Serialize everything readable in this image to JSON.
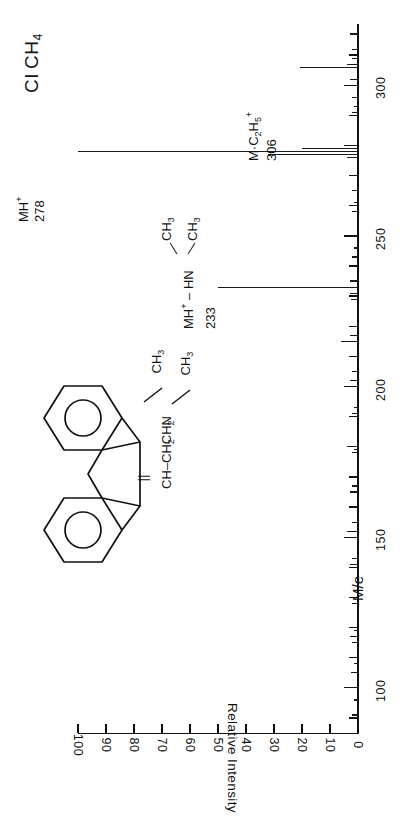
{
  "title": {
    "method": "CI",
    "reagent_gas": "CH",
    "reagent_gas_sub": "4"
  },
  "axes": {
    "x_axis_label": "M/e",
    "y_axis_label": "Relative Intensity",
    "mz_ticks": [
      100,
      150,
      200,
      250,
      300
    ],
    "intensity_ticks": [
      0,
      10,
      20,
      30,
      40,
      50,
      60,
      70,
      80,
      90,
      100
    ]
  },
  "annotations": [
    {
      "id": "ann278",
      "line1": "MH",
      "sup1": "+",
      "line2": "278",
      "mz": 278
    },
    {
      "id": "ann306",
      "line1": "M·C",
      "sub1": "2",
      "mid1": "H",
      "sub2": "5",
      "sup1": "+",
      "line2": "306",
      "mz": 306
    },
    {
      "id": "ann233",
      "line1": "MH",
      "sup1": "+",
      "dash": "–",
      "hn": "HN",
      "ch3_a": "CH",
      "ch3_a_sub": "3",
      "ch3_b": "CH",
      "ch3_b_sub": "3",
      "line2": "233",
      "mz": 233
    }
  ],
  "structure": {
    "name": "amitriptyline",
    "side_chain_1": "CH",
    "side_chain_2": "–CH",
    "side_chain_2_sub": "2",
    "side_chain_3": "CH",
    "side_chain_3_sub": "2",
    "side_chain_4": "N",
    "methyl_a": "CH",
    "methyl_a_sub": "3",
    "methyl_b": "CH",
    "methyl_b_sub": "3",
    "double_bond": "||"
  },
  "colors": {
    "ink": "#111111",
    "background": "#ffffff",
    "peak": "#1a1a1a"
  },
  "chart_data": {
    "type": "bar",
    "orientation": "horizontal-rotated",
    "xlabel": "M/e",
    "ylabel": "Relative Intensity",
    "xlim": [
      85,
      320
    ],
    "ylim": [
      0,
      100
    ],
    "grid": false,
    "legend": null,
    "x": [
      91,
      96,
      100,
      105,
      108,
      115,
      117,
      119,
      128,
      130,
      141,
      143,
      152,
      155,
      165,
      167,
      178,
      179,
      180,
      191,
      193,
      202,
      205,
      215,
      217,
      220,
      229,
      231,
      233,
      235,
      243,
      246,
      250,
      258,
      261,
      265,
      270,
      276,
      277,
      278,
      279,
      280,
      291,
      293,
      296,
      302,
      306,
      307,
      309,
      312,
      317
    ],
    "y": [
      2,
      1.5,
      4,
      2.5,
      1.5,
      2,
      3,
      1.5,
      2,
      1.5,
      3,
      2,
      4,
      2,
      3,
      2,
      2,
      1.5,
      4,
      2,
      1.5,
      3,
      2,
      6,
      3,
      2,
      2.5,
      3,
      27,
      3,
      2,
      1.5,
      2.5,
      2,
      1.5,
      2,
      2.5,
      4,
      32,
      100,
      20,
      5,
      2,
      1.5,
      2,
      3,
      14,
      4,
      2,
      2,
      3
    ],
    "labeled_peaks": [
      {
        "mz": 278,
        "intensity": 100,
        "label": "MH+ 278"
      },
      {
        "mz": 233,
        "intensity": 27,
        "label": "MH+ - HN(CH3)2  233"
      },
      {
        "mz": 306,
        "intensity": 14,
        "label": "M.C2H5+ 306"
      }
    ]
  }
}
